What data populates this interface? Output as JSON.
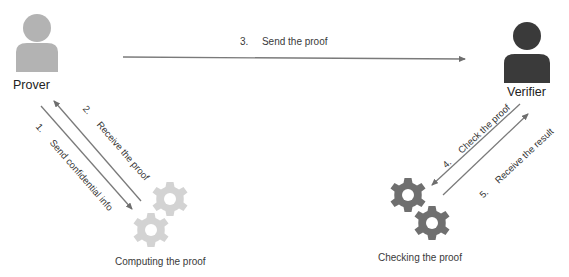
{
  "actors": {
    "prover": {
      "name": "Prover",
      "color": "#b3b3b3"
    },
    "verifier": {
      "name": "Verifier",
      "color": "#3a3a3a"
    }
  },
  "processes": {
    "computing": {
      "label": "Computing the proof",
      "color": "#d3d3d3"
    },
    "checking": {
      "label": "Checking the proof",
      "color": "#6f6f6f"
    }
  },
  "steps": [
    {
      "num": "1.",
      "label": "Send confidential info"
    },
    {
      "num": "2.",
      "label": "Receive the proof"
    },
    {
      "num": "3.",
      "label": "Send the proof"
    },
    {
      "num": "4.",
      "label": "Check the proof"
    },
    {
      "num": "5.",
      "label": "Receive the result"
    }
  ],
  "colors": {
    "arrow": "#7a7a7a",
    "background": "#ffffff"
  }
}
